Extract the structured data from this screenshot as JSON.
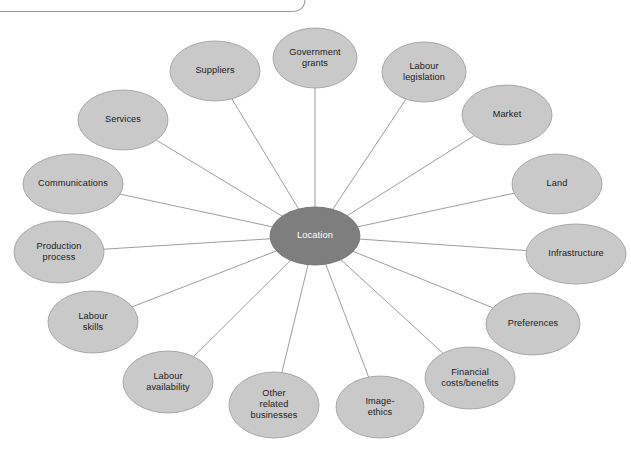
{
  "diagram": {
    "type": "radial-spider-diagram",
    "title": "Location",
    "center": {
      "id": "location",
      "label": "Location",
      "lines": [
        "Location"
      ],
      "cx": 315,
      "cy": 236,
      "rx": 45,
      "ry": 29,
      "fill": "#7e7e7e",
      "text_color": "#ffffff"
    },
    "node_style": {
      "fill": "#c9c9c9",
      "stroke": "#9a9a9a",
      "text_color": "#1a1a1a"
    },
    "connector_color": "#8d8d8d",
    "frame_color": "#9b9b9b",
    "nodes": [
      {
        "id": "government-grants",
        "label": "Government grants",
        "lines": [
          "Government",
          "grants"
        ],
        "cx": 315,
        "cy": 58,
        "rx": 42,
        "ry": 30
      },
      {
        "id": "labour-legislation",
        "label": "Labour legislation",
        "lines": [
          "Labour",
          "legislation"
        ],
        "cx": 424,
        "cy": 72,
        "rx": 42,
        "ry": 30
      },
      {
        "id": "market",
        "label": "Market",
        "lines": [
          "Market"
        ],
        "cx": 507,
        "cy": 115,
        "rx": 45,
        "ry": 30
      },
      {
        "id": "land",
        "label": "Land",
        "lines": [
          "Land"
        ],
        "cx": 557,
        "cy": 184,
        "rx": 45,
        "ry": 30
      },
      {
        "id": "infrastructure",
        "label": "Infrastructure",
        "lines": [
          "Infrastructure"
        ],
        "cx": 576,
        "cy": 254,
        "rx": 50,
        "ry": 30
      },
      {
        "id": "preferences",
        "label": "Preferences",
        "lines": [
          "Preferences"
        ],
        "cx": 533,
        "cy": 324,
        "rx": 47,
        "ry": 31
      },
      {
        "id": "financial-costs-benefits",
        "label": "Financial costs/benefits",
        "lines": [
          "Financial",
          "costs/benefits"
        ],
        "cx": 470,
        "cy": 378,
        "rx": 45,
        "ry": 31
      },
      {
        "id": "image-ethics",
        "label": "Image-ethics",
        "lines": [
          "Image-",
          "ethics"
        ],
        "cx": 380,
        "cy": 407,
        "rx": 44,
        "ry": 31
      },
      {
        "id": "other-related-businesses",
        "label": "Other related businesses",
        "lines": [
          "Other",
          "related",
          "businesses"
        ],
        "cx": 274,
        "cy": 405,
        "rx": 45,
        "ry": 33
      },
      {
        "id": "labour-availability",
        "label": "Labour availability",
        "lines": [
          "Labour",
          "availability"
        ],
        "cx": 168,
        "cy": 382,
        "rx": 45,
        "ry": 31
      },
      {
        "id": "labour-skills",
        "label": "Labour skills",
        "lines": [
          "Labour",
          "skills"
        ],
        "cx": 93,
        "cy": 322,
        "rx": 45,
        "ry": 31
      },
      {
        "id": "production-process",
        "label": "Production process",
        "lines": [
          "Production",
          "process"
        ],
        "cx": 59,
        "cy": 252,
        "rx": 45,
        "ry": 31
      },
      {
        "id": "communications",
        "label": "Communications",
        "lines": [
          "Communications"
        ],
        "cx": 73,
        "cy": 184,
        "rx": 50,
        "ry": 30
      },
      {
        "id": "services",
        "label": "Services",
        "lines": [
          "Services"
        ],
        "cx": 123,
        "cy": 120,
        "rx": 45,
        "ry": 30
      },
      {
        "id": "suppliers",
        "label": "Suppliers",
        "lines": [
          "Suppliers"
        ],
        "cx": 215,
        "cy": 71,
        "rx": 45,
        "ry": 30
      }
    ]
  },
  "frame": {
    "id": "page-frame-fragment",
    "description": "rounded rectangle border fragment"
  }
}
